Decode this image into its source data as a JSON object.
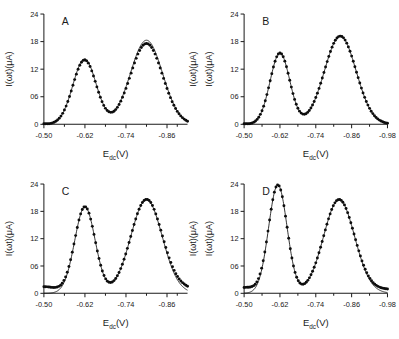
{
  "figure": {
    "type": "multi-panel-plot",
    "panel_count": 4,
    "background": "#ffffff",
    "ink_color": "#111111"
  },
  "chart_data": [
    {
      "type": "line",
      "panel": "A",
      "title": "A",
      "xlabel": "E",
      "xlabel_sub": "dc",
      "xlabel_unit": "(V)",
      "ylabel": "I(ωt)(μA)",
      "xlim": [
        -0.5,
        -0.92
      ],
      "ylim": [
        0,
        24
      ],
      "xticks": [
        -0.5,
        -0.62,
        -0.74,
        -0.86
      ],
      "xticklabels": [
        "-0.50",
        "-0.62",
        "-0.74",
        "-0.86"
      ],
      "yticks": [
        0,
        6,
        12,
        18,
        24
      ],
      "yticklabels": [
        "0",
        "06",
        "12",
        "18",
        "24"
      ],
      "grid": false,
      "legend": "none",
      "right_ylabel": "I(ωt)(μA)",
      "series": [
        {
          "name": "theory",
          "style": "solid-line",
          "peaks": [
            {
              "center": -0.619,
              "height": 14.2,
              "width": 0.034
            },
            {
              "center": -0.8,
              "height": 18.3,
              "width": 0.047
            }
          ]
        },
        {
          "name": "experiment",
          "style": "filled-circles",
          "marker_count": 84,
          "peaks": [
            {
              "center": -0.619,
              "height": 14.0,
              "width": 0.034
            },
            {
              "center": -0.8,
              "height": 17.6,
              "width": 0.047
            }
          ]
        }
      ]
    },
    {
      "type": "line",
      "panel": "B",
      "title": "B",
      "xlabel": "E",
      "xlabel_sub": "dc",
      "xlabel_unit": "(V)",
      "ylabel": "I(ωt)(μA)",
      "xlim": [
        -0.5,
        -0.98
      ],
      "ylim": [
        0,
        24
      ],
      "xticks": [
        -0.5,
        -0.62,
        -0.74,
        -0.86,
        -0.98
      ],
      "xticklabels": [
        "-0.50",
        "-0.62",
        "-0.74",
        "-0.86",
        "-0.98"
      ],
      "yticks": [
        0,
        6,
        12,
        18,
        24
      ],
      "yticklabels": [
        "0",
        "06",
        "12",
        "18",
        "24"
      ],
      "grid": false,
      "legend": "none",
      "right_ylabel": "",
      "series": [
        {
          "name": "theory",
          "style": "solid-line",
          "peaks": [
            {
              "center": -0.62,
              "height": 15.5,
              "width": 0.033
            },
            {
              "center": -0.822,
              "height": 19.2,
              "width": 0.053
            }
          ]
        },
        {
          "name": "experiment",
          "style": "filled-circles",
          "marker_count": 88,
          "peaks": [
            {
              "center": -0.62,
              "height": 15.5,
              "width": 0.033
            },
            {
              "center": -0.822,
              "height": 19.2,
              "width": 0.053
            }
          ]
        }
      ]
    },
    {
      "type": "line",
      "panel": "C",
      "title": "C",
      "xlabel": "E",
      "xlabel_sub": "dc",
      "xlabel_unit": "(V)",
      "ylabel": "I(ωt)(μA)",
      "xlim": [
        -0.5,
        -0.92
      ],
      "ylim": [
        0,
        24
      ],
      "xticks": [
        -0.5,
        -0.62,
        -0.74,
        -0.86
      ],
      "xticklabels": [
        "-0.50",
        "-0.62",
        "-0.74",
        "-0.86"
      ],
      "yticks": [
        0,
        6,
        12,
        18,
        24
      ],
      "yticklabels": [
        "0",
        "06",
        "12",
        "18",
        "24"
      ],
      "grid": false,
      "legend": "none",
      "right_ylabel": "I(ωt)(μA)",
      "series": [
        {
          "name": "theory",
          "style": "solid-line",
          "peaks": [
            {
              "center": -0.62,
              "height": 19.0,
              "width": 0.03
            },
            {
              "center": -0.8,
              "height": 20.6,
              "width": 0.046
            }
          ]
        },
        {
          "name": "experiment",
          "style": "filled-circles",
          "marker_count": 86,
          "peaks": [
            {
              "center": -0.62,
              "height": 19.0,
              "width": 0.03
            },
            {
              "center": -0.8,
              "height": 20.6,
              "width": 0.046
            }
          ],
          "baseline_offset": 1.6
        }
      ]
    },
    {
      "type": "line",
      "panel": "D",
      "title": "D",
      "xlabel": "E",
      "xlabel_sub": "dc",
      "xlabel_unit": "(V)",
      "ylabel": "I(ωt)(μA)",
      "xlim": [
        -0.5,
        -0.98
      ],
      "ylim": [
        0,
        24
      ],
      "xticks": [
        -0.5,
        -0.62,
        -0.74,
        -0.86,
        -0.98
      ],
      "xticklabels": [
        "-0.50",
        "-0.62",
        "-0.74",
        "-0.86",
        "-0.98"
      ],
      "yticks": [
        0,
        6,
        12,
        18,
        24
      ],
      "yticklabels": [
        "0",
        "06",
        "12",
        "18",
        "24"
      ],
      "grid": false,
      "legend": "none",
      "right_ylabel": "",
      "series": [
        {
          "name": "theory",
          "style": "solid-line",
          "peaks": [
            {
              "center": -0.613,
              "height": 23.8,
              "width": 0.031
            },
            {
              "center": -0.818,
              "height": 20.6,
              "width": 0.052
            }
          ]
        },
        {
          "name": "experiment",
          "style": "filled-circles",
          "marker_count": 90,
          "peaks": [
            {
              "center": -0.613,
              "height": 23.8,
              "width": 0.031
            },
            {
              "center": -0.818,
              "height": 20.6,
              "width": 0.052
            }
          ],
          "baseline_offset": 1.4
        }
      ]
    }
  ]
}
